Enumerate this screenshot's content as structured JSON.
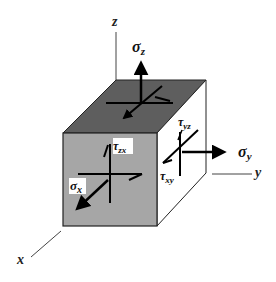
{
  "diagram": {
    "colors": {
      "front_face": "#a6a6a6",
      "top_face": "#5e5e5e",
      "right_face": "#ffffff",
      "edge": "#222222",
      "arrow": "#000000",
      "axis": "#444444",
      "label_bg": "#ffffff"
    },
    "axes": {
      "x": "x",
      "y": "y",
      "z": "z"
    },
    "labels": {
      "sigma_z": "σ",
      "sigma_z_sub": "z",
      "sigma_y": "σ",
      "sigma_y_sub": "y",
      "sigma_x": "σ",
      "sigma_x_sub": "x",
      "tau_zx": "τ",
      "tau_zx_sub": "zx",
      "tau_yz": "τ",
      "tau_yz_sub": "yz",
      "tau_xy": "τ",
      "tau_xy_sub": "xy"
    }
  }
}
